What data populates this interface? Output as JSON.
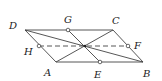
{
  "diagram": {
    "type": "geometry",
    "points": {
      "D": {
        "label": "D",
        "x": 25,
        "y": 30
      },
      "C": {
        "label": "C",
        "x": 113,
        "y": 30
      },
      "A": {
        "label": "A",
        "x": 56,
        "y": 62
      },
      "B": {
        "label": "B",
        "x": 143,
        "y": 62
      },
      "G": {
        "label": "G",
        "x": 68,
        "y": 30
      },
      "E": {
        "label": "E",
        "x": 100,
        "y": 62
      },
      "H": {
        "label": "H",
        "x": 39,
        "y": 46
      },
      "F": {
        "label": "F",
        "x": 128,
        "y": 46
      },
      "O": {
        "label": "",
        "x": 85,
        "y": 46
      }
    },
    "segments": [
      {
        "from": "D",
        "to": "C",
        "style": "solid"
      },
      {
        "from": "C",
        "to": "B",
        "style": "solid"
      },
      {
        "from": "B",
        "to": "A",
        "style": "solid"
      },
      {
        "from": "A",
        "to": "D",
        "style": "solid"
      },
      {
        "from": "D",
        "to": "B",
        "style": "solid"
      },
      {
        "from": "A",
        "to": "C",
        "style": "solid"
      },
      {
        "from": "G",
        "to": "E",
        "style": "solid"
      },
      {
        "from": "H",
        "to": "F",
        "style": "dashed"
      }
    ],
    "stroke_color": "#444444"
  }
}
